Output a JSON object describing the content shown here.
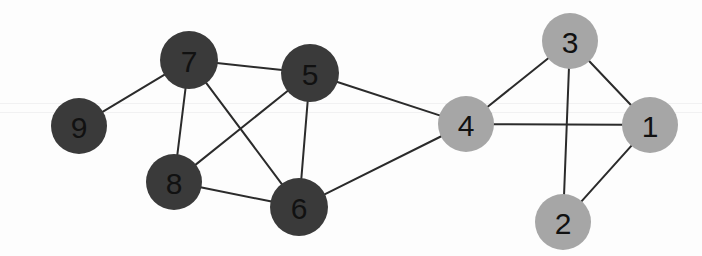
{
  "figure": {
    "width": 702,
    "height": 256,
    "background_color": "#fdfdfd"
  },
  "chart_data": {
    "type": "graph",
    "title": "",
    "xlabel": "",
    "ylabel": "",
    "directed": false,
    "weighted": false,
    "node_count": 9,
    "edge_count": 14,
    "groups": [
      {
        "name": "dark-cluster",
        "color": "#3a3a3a",
        "members": [
          "9",
          "7",
          "5",
          "8",
          "6"
        ]
      },
      {
        "name": "light-cluster",
        "color": "#a6a6a6",
        "members": [
          "4",
          "3",
          "1",
          "2"
        ]
      }
    ],
    "nodes": [
      {
        "id": "9",
        "label": "9",
        "x": 79,
        "y": 126,
        "r": 28,
        "color": "#3a3a3a",
        "label_color": "#111111",
        "degree": 1
      },
      {
        "id": "7",
        "label": "7",
        "x": 189,
        "y": 60,
        "r": 29,
        "color": "#3a3a3a",
        "label_color": "#111111",
        "degree": 4
      },
      {
        "id": "5",
        "label": "5",
        "x": 310,
        "y": 73,
        "r": 29,
        "color": "#3a3a3a",
        "label_color": "#111111",
        "degree": 4
      },
      {
        "id": "8",
        "label": "8",
        "x": 174,
        "y": 182,
        "r": 28,
        "color": "#3a3a3a",
        "label_color": "#111111",
        "degree": 3
      },
      {
        "id": "6",
        "label": "6",
        "x": 299,
        "y": 207,
        "r": 29,
        "color": "#3a3a3a",
        "label_color": "#111111",
        "degree": 4
      },
      {
        "id": "4",
        "label": "4",
        "x": 466,
        "y": 124,
        "r": 28,
        "color": "#a6a6a6",
        "label_color": "#111111",
        "degree": 4
      },
      {
        "id": "3",
        "label": "3",
        "x": 570,
        "y": 41,
        "r": 28,
        "color": "#a6a6a6",
        "label_color": "#111111",
        "degree": 3
      },
      {
        "id": "1",
        "label": "1",
        "x": 650,
        "y": 125,
        "r": 28,
        "color": "#a6a6a6",
        "label_color": "#111111",
        "degree": 3
      },
      {
        "id": "2",
        "label": "2",
        "x": 563,
        "y": 222,
        "r": 28,
        "color": "#a6a6a6",
        "label_color": "#111111",
        "degree": 2
      }
    ],
    "edges": [
      {
        "source": "9",
        "target": "7"
      },
      {
        "source": "7",
        "target": "5"
      },
      {
        "source": "7",
        "target": "8"
      },
      {
        "source": "7",
        "target": "6"
      },
      {
        "source": "5",
        "target": "8"
      },
      {
        "source": "5",
        "target": "6"
      },
      {
        "source": "5",
        "target": "4"
      },
      {
        "source": "8",
        "target": "6"
      },
      {
        "source": "6",
        "target": "4"
      },
      {
        "source": "4",
        "target": "3"
      },
      {
        "source": "4",
        "target": "1"
      },
      {
        "source": "3",
        "target": "1"
      },
      {
        "source": "3",
        "target": "2"
      },
      {
        "source": "2",
        "target": "1"
      }
    ],
    "edge_style": {
      "color": "#2b2b2b",
      "width": 2
    },
    "artifacts": [
      {
        "name": "scanline-band",
        "y": 103
      },
      {
        "name": "scanline-band",
        "y": 112
      }
    ]
  }
}
